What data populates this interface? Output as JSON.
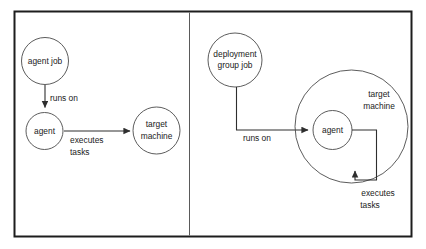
{
  "diagram": {
    "background_color": "#ffffff",
    "frame": {
      "border_color": "#1d1d1d",
      "divider_color": "#5a5a5a"
    },
    "stroke_color": "#4a4a4a",
    "edge_color": "#2e2e2e",
    "text_color": "#1a1a1a",
    "panels": [
      {
        "id": "agent-job-panel",
        "name": "agent job panel",
        "nodes": [
          {
            "id": "agent-job",
            "label": "agent job",
            "shape": "circle"
          },
          {
            "id": "agent",
            "label": "agent",
            "shape": "circle"
          },
          {
            "id": "target-machine",
            "label_line1": "target",
            "label_line2": "machine",
            "shape": "circle"
          }
        ],
        "edges": [
          {
            "id": "agent-job-to-agent",
            "label": "runs on",
            "from": "agent job",
            "to": "agent"
          },
          {
            "id": "agent-to-target",
            "label_line1": "executes",
            "label_line2": "tasks",
            "from": "agent",
            "to": "target machine"
          }
        ]
      },
      {
        "id": "deployment-group-job-panel",
        "name": "deployment group job panel",
        "nodes": [
          {
            "id": "deployment-group-job",
            "label_line1": "deployment",
            "label_line2": "group job",
            "shape": "circle"
          },
          {
            "id": "target-machine-container",
            "label_line1": "target",
            "label_line2": "machine",
            "shape": "circle"
          },
          {
            "id": "agent-inner",
            "label": "agent",
            "shape": "circle"
          }
        ],
        "edges": [
          {
            "id": "deployment-job-to-agent",
            "label": "runs on",
            "from": "deployment group job",
            "to": "agent"
          },
          {
            "id": "agent-to-machine-loop",
            "label_line1": "executes",
            "label_line2": "tasks",
            "from": "agent",
            "to": "target machine"
          }
        ]
      }
    ]
  }
}
